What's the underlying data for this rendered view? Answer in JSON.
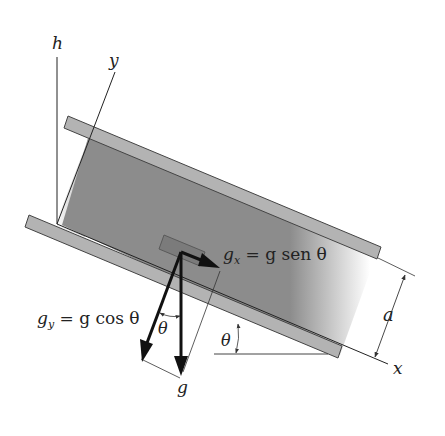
{
  "figure": {
    "labels": {
      "h": "h",
      "y": "y",
      "x": "x",
      "a": "a",
      "g": "g",
      "theta_incline": "θ",
      "theta_vector": "θ"
    },
    "equations": {
      "gx_lhs": "g",
      "gx_sub": "x",
      "gx_rhs": " = g sen θ",
      "gy_lhs": "g",
      "gy_sub": "y",
      "gy_rhs": " = g cos θ"
    },
    "colors": {
      "fluid_gray": "#8c8c8c",
      "plate_fill": "#b3b3b3",
      "plate_stroke": "#444444",
      "line": "#222222",
      "background": "#ffffff"
    }
  }
}
